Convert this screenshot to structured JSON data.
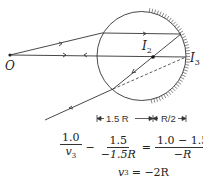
{
  "labels": {
    "object": "O",
    "image2": "I",
    "image2_sub": "2",
    "image3": "I",
    "image3_sub": "3"
  },
  "dimensions": {
    "left": "1.5 R",
    "right": "R/2"
  },
  "equation1": {
    "term1_num": "1.0",
    "term1_den_var": "v",
    "term1_den_sub": "3",
    "minus": "−",
    "term2_num": "1.5",
    "term2_den": "−1.5R",
    "equals": "=",
    "term3_num": "1.0 − 1.5",
    "term3_den": "−R"
  },
  "equation2": {
    "lhs_var": "v",
    "lhs_sub": "3",
    "rhs": "= −2R"
  },
  "colors": {
    "line": "#333333",
    "background": "#ffffff"
  }
}
